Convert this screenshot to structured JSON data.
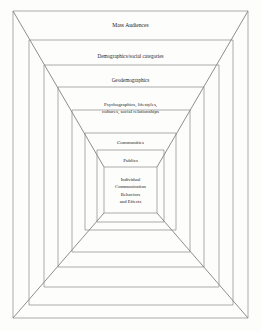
{
  "figure": {
    "background_color": "#fdfdfc",
    "line_color": "#86868a",
    "diagonal_color": "#5d5d61",
    "text_color": "#1d1d1d"
  },
  "chart_data": {
    "type": "diagram",
    "layout": "one-point perspective nested rectangles (tunnel)",
    "grid": false,
    "legend": false,
    "outer_frame": {
      "x1": 13,
      "y1": 11,
      "x2": 248,
      "y2": 318
    },
    "vanishing_point": {
      "x": 130.5,
      "y": 190
    },
    "levels": [
      {
        "index": 0,
        "label": "Mass Audiences",
        "rect": {
          "x1": 13,
          "y1": 11,
          "x2": 248,
          "y2": 318
        }
      },
      {
        "index": 1,
        "label": "Demographics/social categories",
        "rect": {
          "x1": 29,
          "y1": 40,
          "x2": 233,
          "y2": 305
        }
      },
      {
        "index": 2,
        "label": "Geodemographics",
        "rect": {
          "x1": 44,
          "y1": 65,
          "x2": 219,
          "y2": 287
        }
      },
      {
        "index": 3,
        "label": "Psychographics, lifestyles, cultures, social relationships",
        "rect": {
          "x1": 58,
          "y1": 87,
          "x2": 204,
          "y2": 267
        }
      },
      {
        "index": 4,
        "label": "Communities",
        "rect": {
          "x1": 72,
          "y1": 110,
          "x2": 190,
          "y2": 252
        }
      },
      {
        "index": 5,
        "label": "Publics",
        "rect": {
          "x1": 85,
          "y1": 133,
          "x2": 176,
          "y2": 230
        }
      },
      {
        "index": 6,
        "label": "Individual Communication Behaviors and Effects",
        "rect": {
          "x1": 97,
          "y1": 150,
          "x2": 164,
          "y2": 222
        }
      },
      {
        "index": 7,
        "label": "",
        "rect": {
          "x1": 104,
          "y1": 167,
          "x2": 157,
          "y2": 213
        }
      }
    ]
  },
  "bands": [
    {
      "id": "mass-audiences",
      "name": "band-label-mass-audiences",
      "lines": [
        "Mass Audiences"
      ],
      "x": 130.5,
      "y": 26,
      "size": "size-lg",
      "line_height": 7
    },
    {
      "id": "demographics",
      "name": "band-label-demographics",
      "lines": [
        "Demographics/social categories"
      ],
      "x": 130.5,
      "y": 56.5,
      "size": "size-md",
      "line_height": 7
    },
    {
      "id": "geodemographics",
      "name": "band-label-geodemographics",
      "lines": [
        "Geodemographics"
      ],
      "x": 130.5,
      "y": 81,
      "size": "size-md",
      "line_height": 7
    },
    {
      "id": "psychographics",
      "name": "band-label-psychographics",
      "lines": [
        "Psychographics, lifestyles,",
        "cultures, social relationships"
      ],
      "x": 130.5,
      "y": 105,
      "size": "size-sm",
      "line_height": 7.2
    },
    {
      "id": "communities",
      "name": "band-label-communities",
      "lines": [
        "Communities"
      ],
      "x": 130.5,
      "y": 143,
      "size": "size-sm",
      "line_height": 7
    },
    {
      "id": "publics",
      "name": "band-label-publics",
      "lines": [
        "Publics"
      ],
      "x": 130.5,
      "y": 160.5,
      "size": "size-sm",
      "line_height": 7
    },
    {
      "id": "individual-effects",
      "name": "band-label-individual-effects",
      "lines": [
        "Individual",
        "Communication",
        "Behaviors",
        "and  Effects"
      ],
      "x": 130.5,
      "y": 180,
      "size": "size-xs",
      "line_height": 7.4
    }
  ]
}
